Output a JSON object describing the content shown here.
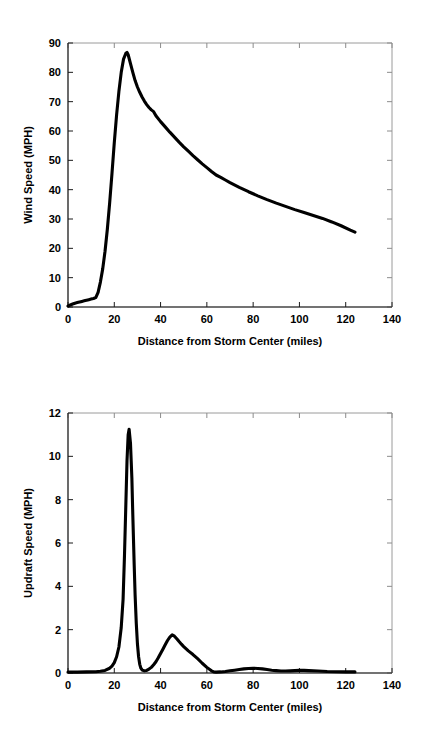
{
  "page": {
    "background_color": "#ffffff",
    "line_color": "#000000",
    "axis_color": "#9a9a9a",
    "text_color": "#000000"
  },
  "chart_data": [
    {
      "id": "wind-speed",
      "type": "line",
      "title": "",
      "xlabel": "Distance from Storm Center (miles)",
      "ylabel": "Wind Speed (MPH)",
      "xlim": [
        0,
        140
      ],
      "ylim": [
        0,
        90
      ],
      "xticks": [
        0,
        20,
        40,
        60,
        80,
        100,
        120,
        140
      ],
      "yticks": [
        0,
        10,
        20,
        30,
        40,
        50,
        60,
        70,
        80,
        90
      ],
      "xticklabels": [
        "0",
        "20",
        "40",
        "60",
        "80",
        "100",
        "120",
        "140"
      ],
      "yticklabels": [
        "0",
        "10",
        "20",
        "30",
        "40",
        "50",
        "60",
        "70",
        "80",
        "90"
      ],
      "grid": false,
      "legend": "none",
      "series": [
        {
          "name": "Wind Speed",
          "color": "#000000",
          "x": [
            0,
            1,
            2,
            3,
            4,
            5,
            6,
            7,
            8,
            9,
            10,
            11,
            12,
            13,
            14,
            15,
            16,
            17,
            18,
            19,
            20,
            21,
            22,
            23,
            24,
            25,
            25.5,
            26,
            27,
            28,
            29,
            30,
            31,
            32,
            33,
            34,
            35,
            36,
            37,
            38,
            40,
            42,
            44,
            46,
            48,
            50,
            52,
            54,
            56,
            58,
            60,
            62,
            64,
            66,
            68,
            70,
            74,
            78,
            82,
            86,
            90,
            94,
            98,
            102,
            106,
            110,
            114,
            118,
            122,
            124
          ],
          "y": [
            0.3,
            0.7,
            1.0,
            1.3,
            1.5,
            1.7,
            1.9,
            2.1,
            2.3,
            2.5,
            2.7,
            2.9,
            3.2,
            5.0,
            8.5,
            13.0,
            19.0,
            26.5,
            35.5,
            45.5,
            56.0,
            65.5,
            73.5,
            80.0,
            84.5,
            86.5,
            86.8,
            86.0,
            83.0,
            80.0,
            77.2,
            75.0,
            73.2,
            71.6,
            70.2,
            69.0,
            68.0,
            67.2,
            66.6,
            65.2,
            63.2,
            61.4,
            59.6,
            57.9,
            56.2,
            54.6,
            53.1,
            51.6,
            50.2,
            48.8,
            47.5,
            46.2,
            45.0,
            44.2,
            43.3,
            42.4,
            40.8,
            39.3,
            37.9,
            36.6,
            35.4,
            34.3,
            33.2,
            32.2,
            31.2,
            30.2,
            29.0,
            27.7,
            26.2,
            25.5
          ]
        }
      ],
      "annotations": {
        "peak_value": "86.8",
        "peak_location": "25.5",
        "end_value": "25.5",
        "end_location": "124"
      }
    },
    {
      "id": "updraft-speed",
      "type": "line",
      "title": "",
      "xlabel": "Distance from Storm Center (miles)",
      "ylabel": "Updraft Speed (MPH)",
      "xlim": [
        0,
        140
      ],
      "ylim": [
        0,
        12
      ],
      "xticks": [
        0,
        20,
        40,
        60,
        80,
        100,
        120,
        140
      ],
      "yticks": [
        0,
        2,
        4,
        6,
        8,
        10,
        12
      ],
      "xticklabels": [
        "0",
        "20",
        "40",
        "60",
        "80",
        "100",
        "120",
        "140"
      ],
      "yticklabels": [
        "0",
        "2",
        "4",
        "6",
        "8",
        "10",
        "12"
      ],
      "grid": false,
      "legend": "none",
      "series": [
        {
          "name": "Updraft Speed",
          "color": "#000000",
          "x": [
            0,
            4,
            8,
            12,
            14,
            16,
            18,
            19,
            20,
            21,
            22,
            23,
            23.8,
            24.4,
            25,
            25.5,
            26,
            26.4,
            27,
            27.6,
            28,
            28.6,
            29,
            29.5,
            30,
            30.5,
            31,
            31.5,
            32,
            33,
            34,
            35,
            36,
            37,
            38,
            39,
            40,
            41,
            42,
            43,
            44,
            45,
            46,
            47,
            48,
            49,
            50,
            52,
            54,
            56,
            58,
            60,
            62,
            63,
            64,
            66,
            68,
            70,
            72,
            74,
            76,
            78,
            80,
            82,
            84,
            86,
            88,
            90,
            92,
            94,
            96,
            98,
            100,
            102,
            104,
            108,
            112,
            116,
            120,
            124
          ],
          "y": [
            0.04,
            0.04,
            0.05,
            0.06,
            0.08,
            0.12,
            0.22,
            0.32,
            0.48,
            0.75,
            1.2,
            2.1,
            3.4,
            5.4,
            7.8,
            9.8,
            11.0,
            11.25,
            10.6,
            9.0,
            7.3,
            5.0,
            3.6,
            2.3,
            1.35,
            0.75,
            0.4,
            0.22,
            0.14,
            0.1,
            0.12,
            0.18,
            0.26,
            0.38,
            0.52,
            0.7,
            0.9,
            1.1,
            1.3,
            1.5,
            1.66,
            1.76,
            1.7,
            1.58,
            1.45,
            1.33,
            1.22,
            1.02,
            0.85,
            0.66,
            0.45,
            0.26,
            0.1,
            0.05,
            0.04,
            0.05,
            0.07,
            0.1,
            0.13,
            0.16,
            0.19,
            0.21,
            0.22,
            0.21,
            0.19,
            0.16,
            0.13,
            0.11,
            0.09,
            0.09,
            0.1,
            0.11,
            0.12,
            0.12,
            0.11,
            0.09,
            0.07,
            0.06,
            0.05,
            0.05
          ]
        }
      ],
      "annotations": {
        "peak_value": "11.25",
        "peak_location": "26.4",
        "secondary_peak_value": "1.76",
        "secondary_peak_location": "45",
        "end_location": "124"
      }
    }
  ]
}
